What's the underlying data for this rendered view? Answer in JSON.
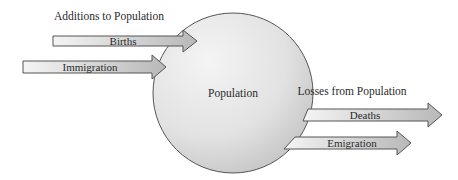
{
  "diagram": {
    "type": "stock-and-flow",
    "headings": {
      "additions": "Additions to Population",
      "losses": "Losses from Population"
    },
    "stock": {
      "label": "Population"
    },
    "inflows": [
      {
        "label": "Births"
      },
      {
        "label": "Immigration"
      }
    ],
    "outflows": [
      {
        "label": "Deaths"
      },
      {
        "label": "Emigration"
      }
    ],
    "colors": {
      "circle_fill_light": "#f2f2f2",
      "circle_fill_dark": "#c4c4c4",
      "arrow_fill_light": "#f0f0f0",
      "arrow_fill_dark": "#b8b8b8",
      "outline": "#555555",
      "text": "#2a2a2a"
    }
  }
}
